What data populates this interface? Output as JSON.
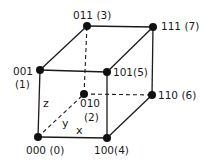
{
  "diagram": {
    "vertices": [
      {
        "id": "v000",
        "code": "000",
        "index": "(0)",
        "x": 38,
        "y": 137
      },
      {
        "id": "v001",
        "code": "001",
        "index": "(1)",
        "x": 40,
        "y": 70
      },
      {
        "id": "v010",
        "code": "010",
        "index": "(2)",
        "x": 84,
        "y": 94
      },
      {
        "id": "v011",
        "code": "011",
        "index": "(3)",
        "x": 87,
        "y": 26
      },
      {
        "id": "v100",
        "code": "100",
        "index": "(4)",
        "x": 107,
        "y": 138
      },
      {
        "id": "v101",
        "code": "101",
        "index": "(5)",
        "x": 107,
        "y": 72
      },
      {
        "id": "v110",
        "code": "110",
        "index": "(6)",
        "x": 152,
        "y": 95
      },
      {
        "id": "v111",
        "code": "111",
        "index": "(7)",
        "x": 153,
        "y": 27
      }
    ],
    "labels": {
      "v000": "000 (0)",
      "v001_code": "001",
      "v001_index": "(1)",
      "v010_code": "010",
      "v010_index": "(2)",
      "v011": "011 (3)",
      "v100": "100(4)",
      "v101": "101(5)",
      "v110": "110 (6)",
      "v111": "111 (7)"
    },
    "axes": {
      "x": "x",
      "y": "y",
      "z": "z"
    },
    "colors": {
      "line": "#1a1a1a",
      "vertex": "#111111"
    }
  }
}
